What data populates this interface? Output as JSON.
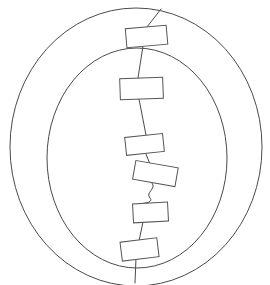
{
  "figure": {
    "canvas": {
      "width": 270,
      "height": 285,
      "background": "#ffffff"
    },
    "stroke_color": "#4a4a4a",
    "node_stroke_color": "#555555",
    "node_fill_color": "#ffffff",
    "stroke_width": 1
  },
  "chart_data": {
    "type": "diagram",
    "grid": false,
    "legend": null,
    "rings": [
      {
        "name": "outer-ring",
        "cx": 136,
        "cy": 147,
        "rx": 126,
        "ry": 139
      },
      {
        "name": "inner-ring",
        "cx": 137,
        "cy": 158,
        "rx": 90,
        "ry": 110
      }
    ],
    "nodes": [
      {
        "id": 1,
        "cx": 146,
        "cy": 36,
        "w": 41,
        "h": 19,
        "rotation": -5
      },
      {
        "id": 2,
        "cx": 141,
        "cy": 88,
        "w": 43,
        "h": 21,
        "rotation": -2
      },
      {
        "id": 3,
        "cx": 144,
        "cy": 144,
        "w": 38,
        "h": 18,
        "rotation": -6
      },
      {
        "id": 4,
        "cx": 155,
        "cy": 173,
        "w": 43,
        "h": 19,
        "rotation": 10
      },
      {
        "id": 5,
        "cx": 150,
        "cy": 212,
        "w": 35,
        "h": 19,
        "rotation": -3
      },
      {
        "id": 6,
        "cx": 139,
        "cy": 249,
        "w": 37,
        "h": 19,
        "rotation": -7
      }
    ],
    "connectors": [
      {
        "from": "outer-ring-top",
        "to": 1,
        "style": "straight",
        "path": "M 161,9 L 147,27"
      },
      {
        "from": 1,
        "to": 2,
        "style": "straight",
        "path": "M 143,46 L 138,78"
      },
      {
        "from": 2,
        "to": 3,
        "style": "straight",
        "path": "M 139,99 L 146,135"
      },
      {
        "from": 3,
        "to": 4,
        "style": "straight",
        "path": "M 146,154 L 150,164"
      },
      {
        "from": 4,
        "to": 5,
        "style": "wavy",
        "path": "M 152,183 C 157,189 145,192 150,198 C 154,203 143,203 140,204"
      },
      {
        "from": 5,
        "to": 6,
        "style": "straight",
        "path": "M 143,222 L 139,241"
      },
      {
        "from": 6,
        "to": "outer-ring-bottom",
        "style": "straight",
        "path": "M 136,258 L 135,283"
      }
    ],
    "xlabel": "",
    "ylabel": "",
    "annotations": []
  }
}
